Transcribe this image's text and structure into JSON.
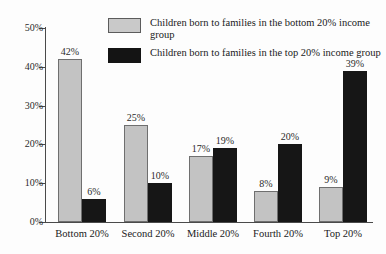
{
  "chart_data": {
    "type": "bar",
    "title": "",
    "subtitle": "",
    "xlabel": "",
    "ylabel": "",
    "ylim": [
      0,
      50
    ],
    "ytick_labels": [
      "0%",
      "10%",
      "20%",
      "30%",
      "40%",
      "50%"
    ],
    "ytick_values": [
      0,
      10,
      20,
      30,
      40,
      50
    ],
    "grid": false,
    "legend_position": "top-center",
    "categories": [
      "Bottom 20%",
      "Second 20%",
      "Middle 20%",
      "Fourth 20%",
      "Top 20%"
    ],
    "series": [
      {
        "name": "Children born to families in the bottom 20% income group",
        "color": "#c3c3c3",
        "values": [
          42,
          25,
          17,
          8,
          9
        ],
        "value_labels": [
          "42%",
          "25%",
          "17%",
          "8%",
          "9%"
        ]
      },
      {
        "name": "Children born to families in the top 20% income group",
        "color": "#161616",
        "values": [
          6,
          10,
          19,
          20,
          39
        ],
        "value_labels": [
          "6%",
          "10%",
          "19%",
          "20%",
          "39%"
        ]
      }
    ]
  },
  "legend": {
    "items": [
      {
        "label": "Children born to families in the bottom 20% income group",
        "swatch": "light-gray-swatch"
      },
      {
        "label": "Children born to families in the top 20% income group",
        "swatch": "black-swatch"
      }
    ]
  },
  "colors": {
    "light_bar": "#c3c3c3",
    "dark_bar": "#161616",
    "axis": "#4a4a4a",
    "background": "#fdfdfd",
    "text": "#1a1a1a"
  }
}
